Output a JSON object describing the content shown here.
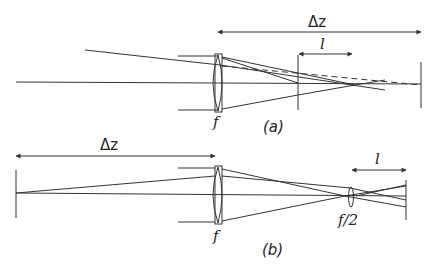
{
  "diagram": {
    "panel_a": {
      "caption": "(a)",
      "lens_label": "f",
      "delta_z_label": "Δz",
      "l_label": "l",
      "elements": [
        "optical-axis",
        "lens-f",
        "screen-near",
        "screen-far",
        "focus-point",
        "dashed-ray"
      ]
    },
    "panel_b": {
      "caption": "(b)",
      "lens_label": "f",
      "small_lens_label": "f/2",
      "delta_z_label": "Δz",
      "l_label": "l",
      "elements": [
        "optical-axis",
        "source-screen",
        "lens-f",
        "lens-f-half",
        "screen-right"
      ]
    },
    "colors": {
      "line": "#333333",
      "background": "#ffffff"
    }
  }
}
